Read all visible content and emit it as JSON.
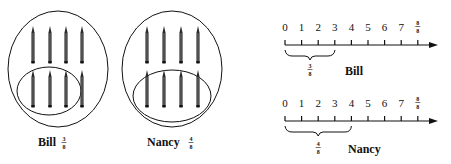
{
  "figures": {
    "bill_set": {
      "name": "Bill",
      "fraction": {
        "numerator": "3",
        "denominator": "8"
      },
      "total_pencils": 8,
      "circled_pencils": 3
    },
    "nancy_set": {
      "name": "Nancy",
      "fraction": {
        "numerator": "4",
        "denominator": "8"
      },
      "total_pencils": 8,
      "circled_pencils": 4
    }
  },
  "number_lines": [
    {
      "name": "Bill",
      "tick_labels": [
        "0",
        "1",
        "2",
        "3",
        "4",
        "5",
        "6",
        "7"
      ],
      "end_label": {
        "numerator": "8",
        "denominator": "8"
      },
      "bracket_from": 0,
      "bracket_to": 3,
      "bracket_fraction": {
        "numerator": "3",
        "denominator": "8"
      }
    },
    {
      "name": "Nancy",
      "tick_labels": [
        "0",
        "1",
        "2",
        "3",
        "4",
        "5",
        "6",
        "7"
      ],
      "end_label": {
        "numerator": "8",
        "denominator": "8"
      },
      "bracket_from": 0,
      "bracket_to": 4,
      "bracket_fraction": {
        "numerator": "4",
        "denominator": "8"
      }
    }
  ],
  "colors": {
    "ink": "#111111",
    "pencil": "#2a2a2a",
    "background": "#ffffff"
  }
}
